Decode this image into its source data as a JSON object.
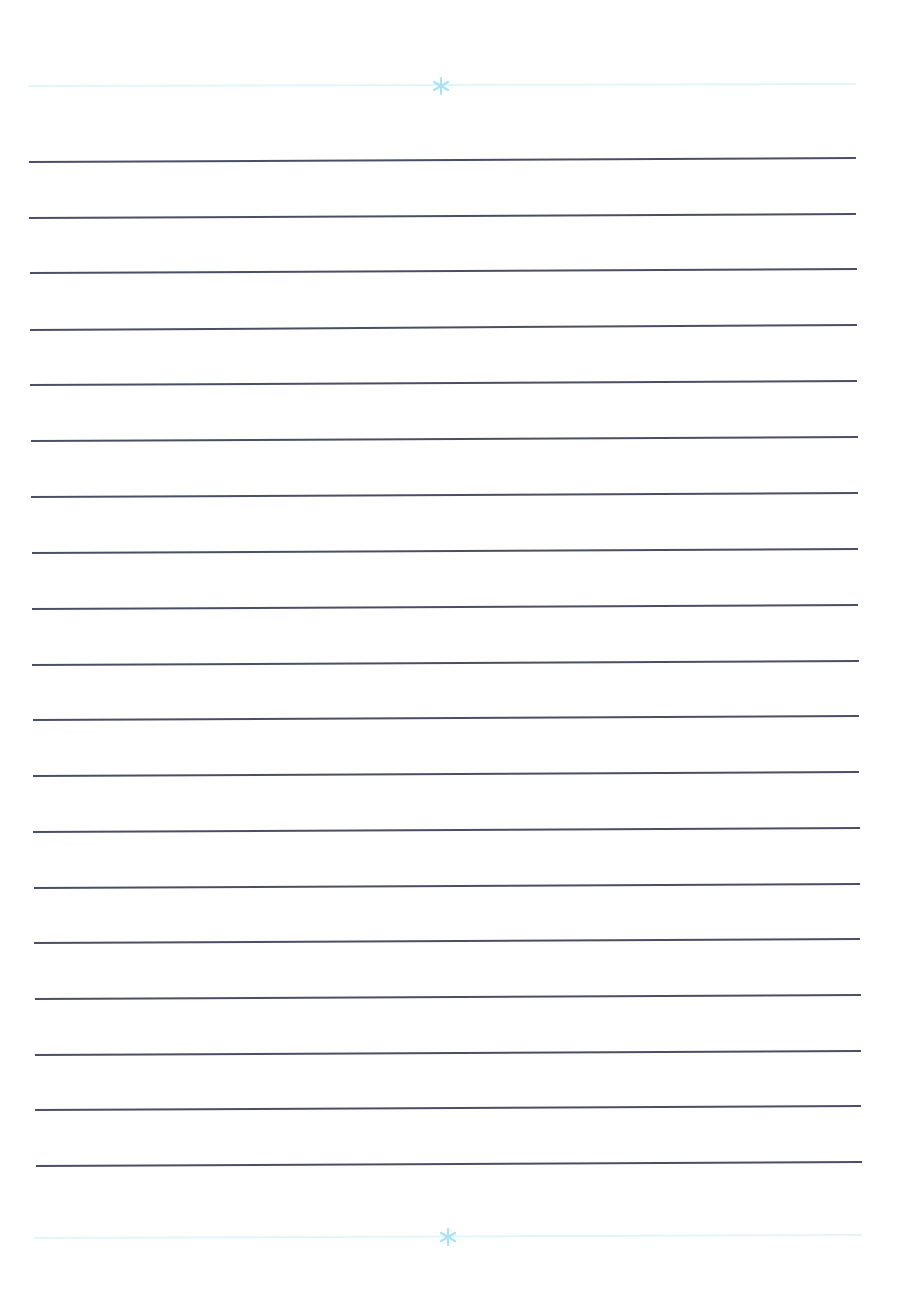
{
  "page": {
    "type": "blank lined writing paper",
    "background_color": "#ffffff",
    "line_color": "#3b4058",
    "decoration_color": "#e2f6fa",
    "ornament_color": "#a9e2f2"
  },
  "top_decoration": {
    "ornament": "asterisk-ornament",
    "y": 86,
    "x1": 28,
    "x2": 856,
    "ornament_x": 441
  },
  "bottom_decoration": {
    "ornament": "asterisk-ornament",
    "y": 1237,
    "x1": 34,
    "x2": 862,
    "ornament_x": 448
  },
  "ruled_lines": [
    {
      "x1": 29,
      "y1": 162,
      "x2": 856,
      "y2": 158
    },
    {
      "x1": 29,
      "y1": 218,
      "x2": 856,
      "y2": 214
    },
    {
      "x1": 30,
      "y1": 273,
      "x2": 857,
      "y2": 269
    },
    {
      "x1": 30,
      "y1": 330,
      "x2": 857,
      "y2": 325
    },
    {
      "x1": 30,
      "y1": 385,
      "x2": 857,
      "y2": 381
    },
    {
      "x1": 31,
      "y1": 441,
      "x2": 858,
      "y2": 437
    },
    {
      "x1": 31,
      "y1": 497,
      "x2": 858,
      "y2": 493
    },
    {
      "x1": 32,
      "y1": 553,
      "x2": 858,
      "y2": 549
    },
    {
      "x1": 32,
      "y1": 609,
      "x2": 858,
      "y2": 605
    },
    {
      "x1": 32,
      "y1": 665,
      "x2": 859,
      "y2": 661
    },
    {
      "x1": 33,
      "y1": 720,
      "x2": 859,
      "y2": 716
    },
    {
      "x1": 33,
      "y1": 776,
      "x2": 859,
      "y2": 772
    },
    {
      "x1": 33,
      "y1": 832,
      "x2": 860,
      "y2": 828
    },
    {
      "x1": 34,
      "y1": 888,
      "x2": 860,
      "y2": 884
    },
    {
      "x1": 34,
      "y1": 943,
      "x2": 860,
      "y2": 939
    },
    {
      "x1": 35,
      "y1": 999,
      "x2": 861,
      "y2": 995
    },
    {
      "x1": 35,
      "y1": 1055,
      "x2": 861,
      "y2": 1051
    },
    {
      "x1": 35,
      "y1": 1110,
      "x2": 861,
      "y2": 1106
    },
    {
      "x1": 36,
      "y1": 1166,
      "x2": 862,
      "y2": 1162
    }
  ]
}
